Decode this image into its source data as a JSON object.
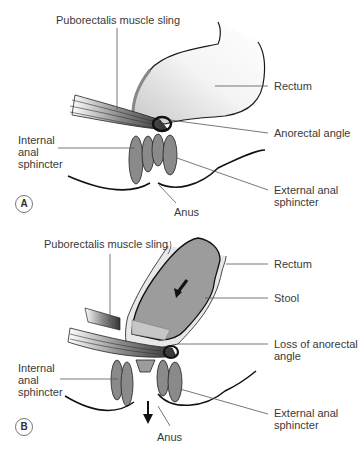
{
  "figure": {
    "panels": [
      {
        "id": "A",
        "badge": "A",
        "state": "normal",
        "labels": {
          "puborectalis": "Puborectalis muscle sling",
          "rectum": "Rectum",
          "anorectal_angle": "Anorectal angle",
          "internal_sphincter_1": "Internal",
          "internal_sphincter_2": "anal",
          "internal_sphincter_3": "sphincter",
          "external_sphincter_1": "External anal",
          "external_sphincter_2": "sphincter",
          "anus": "Anus"
        }
      },
      {
        "id": "B",
        "badge": "B",
        "state": "defecation",
        "labels": {
          "puborectalis": "Puborectalis muscle sling",
          "rectum": "Rectum",
          "stool": "Stool",
          "loss_angle_1": "Loss of anorectal",
          "loss_angle_2": "angle",
          "internal_sphincter_1": "Internal",
          "internal_sphincter_2": "anal",
          "internal_sphincter_3": "sphincter",
          "external_sphincter_1": "External anal",
          "external_sphincter_2": "sphincter",
          "anus": "Anus"
        }
      }
    ],
    "colors": {
      "outline": "#1a1a1a",
      "leader": "#555555",
      "muscle": "#6e6e6e",
      "rectum_fill": "#e6e6e6",
      "stool_fill": "#9a9a9a",
      "sphincter_fill": "#8a8a8a"
    }
  }
}
